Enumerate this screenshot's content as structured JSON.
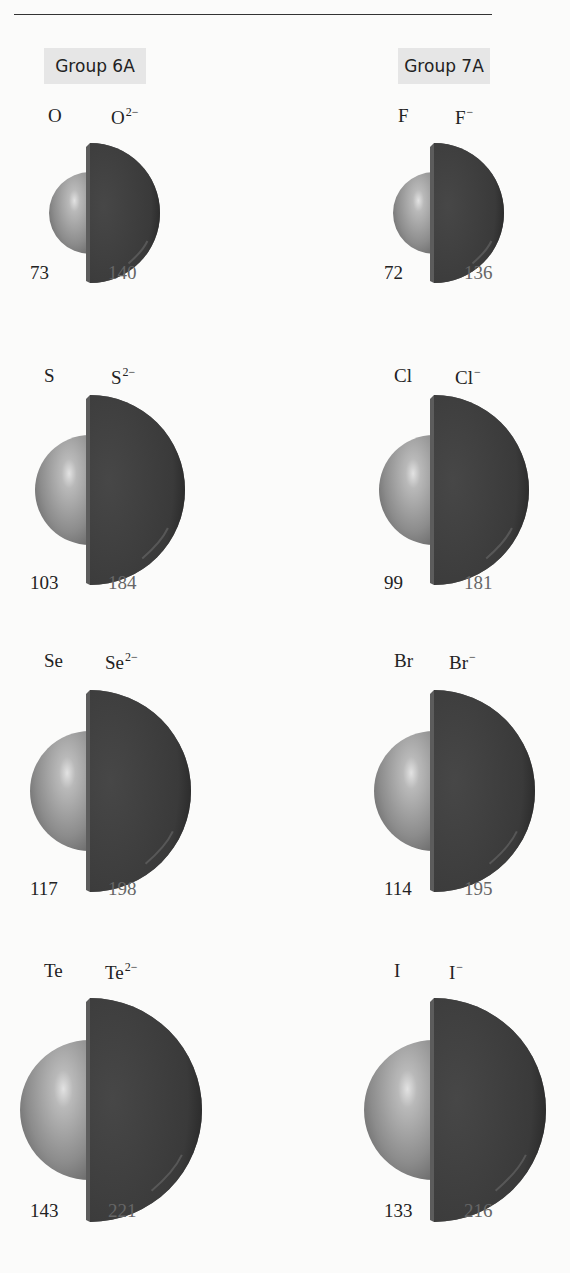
{
  "header": {
    "rule_visible": true
  },
  "groups": [
    {
      "label": "Group 6A",
      "elements": [
        {
          "atom": "O",
          "ion": "O",
          "charge": "2−",
          "atom_radius": "73",
          "ion_radius": "140"
        },
        {
          "atom": "S",
          "ion": "S",
          "charge": "2−",
          "atom_radius": "103",
          "ion_radius": "184"
        },
        {
          "atom": "Se",
          "ion": "Se",
          "charge": "2−",
          "atom_radius": "117",
          "ion_radius": "198"
        },
        {
          "atom": "Te",
          "ion": "Te",
          "charge": "2−",
          "atom_radius": "143",
          "ion_radius": "221"
        }
      ]
    },
    {
      "label": "Group 7A",
      "elements": [
        {
          "atom": "F",
          "ion": "F",
          "charge": "−",
          "atom_radius": "72",
          "ion_radius": "136"
        },
        {
          "atom": "Cl",
          "ion": "Cl",
          "charge": "−",
          "atom_radius": "99",
          "ion_radius": "181"
        },
        {
          "atom": "Br",
          "ion": "Br",
          "charge": "−",
          "atom_radius": "114",
          "ion_radius": "195"
        },
        {
          "atom": "I",
          "ion": "I",
          "charge": "−",
          "atom_radius": "133",
          "ion_radius": "216"
        }
      ]
    }
  ],
  "colors": {
    "atom_sphere": "#9a9a9a",
    "ion_hemisphere": "#3e3e3e",
    "header_bg": "#e6e6e6",
    "ion_number": "#666666"
  }
}
